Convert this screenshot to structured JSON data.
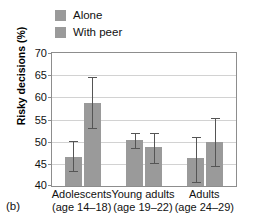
{
  "panel_label": "(b)",
  "legend": {
    "position": "top-left",
    "items": [
      {
        "label": "Alone",
        "color": "#9a9a9a"
      },
      {
        "label": "With peer",
        "color": "#9a9a9a"
      }
    ]
  },
  "axes": {
    "ylabel": "Risky decisions (%)",
    "yticks": [
      "40",
      "45",
      "50",
      "55",
      "60",
      "65",
      "70"
    ]
  },
  "chart_data": {
    "type": "bar",
    "title": "",
    "xlabel": "",
    "ylabel": "Risky decisions (%)",
    "ylim": [
      40,
      70
    ],
    "ytick_values": [
      40,
      45,
      50,
      55,
      60,
      65,
      70
    ],
    "grid": true,
    "legend_position": "top-left",
    "categories": [
      "Adolescents (age 14–18)",
      "Young adults (age 19–22)",
      "Adults (age 24–29)"
    ],
    "category_lines": [
      {
        "line1": "Adolescents",
        "line2": "(age 14–18)"
      },
      {
        "line1": "Young adults",
        "line2": "(age 19–22)"
      },
      {
        "line1": "Adults",
        "line2": "(age 24–29)"
      }
    ],
    "series": [
      {
        "name": "Alone",
        "color": "#9a9a9a",
        "values": [
          46.5,
          50.3,
          46.4
        ],
        "error_low": [
          43.3,
          48.5,
          40.8
        ],
        "error_high": [
          50.2,
          52.0,
          51.0
        ]
      },
      {
        "name": "With peer",
        "color": "#9a9a9a",
        "values": [
          58.8,
          48.7,
          50.0
        ],
        "error_low": [
          53.0,
          45.3,
          44.5
        ],
        "error_high": [
          64.5,
          52.0,
          55.3
        ]
      }
    ]
  }
}
